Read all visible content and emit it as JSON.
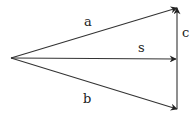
{
  "diagram": {
    "type": "vector-addition",
    "origin": {
      "x": 11,
      "y": 58
    },
    "stroke_color": "#333333",
    "vectors": [
      {
        "id": "a",
        "label": "a",
        "from": {
          "x": 11,
          "y": 58
        },
        "to": {
          "x": 177,
          "y": 8
        },
        "label_pos": {
          "x": 84,
          "y": 26
        }
      },
      {
        "id": "s",
        "label": "s",
        "from": {
          "x": 11,
          "y": 58
        },
        "to": {
          "x": 176,
          "y": 59
        },
        "label_pos": {
          "x": 138,
          "y": 52
        }
      },
      {
        "id": "b",
        "label": "b",
        "from": {
          "x": 11,
          "y": 58
        },
        "to": {
          "x": 177,
          "y": 109
        },
        "label_pos": {
          "x": 83,
          "y": 103
        }
      },
      {
        "id": "c",
        "label": "c",
        "from": {
          "x": 177,
          "y": 109
        },
        "to": {
          "x": 177,
          "y": 8
        },
        "label_pos": {
          "x": 182,
          "y": 37
        }
      }
    ]
  }
}
